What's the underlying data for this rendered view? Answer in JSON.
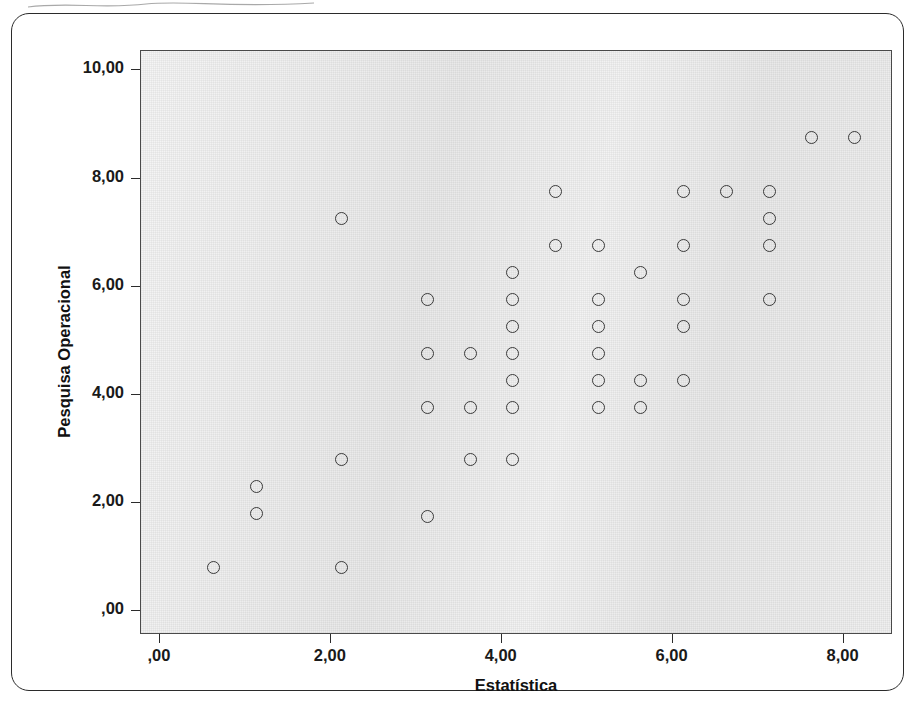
{
  "chart_data": {
    "type": "scatter",
    "title": "",
    "xlabel": "Estatística",
    "ylabel": "Pesquisa Operacional",
    "xlim": [
      -0.35,
      8.45
    ],
    "ylim": [
      -0.2,
      10.6
    ],
    "grid": false,
    "legend": "none",
    "marker": "open-circle",
    "xticks": [
      0,
      2,
      4,
      6,
      8
    ],
    "xticklabels": [
      ",00",
      "2,00",
      "4,00",
      "6,00",
      "8,00"
    ],
    "yticks": [
      0,
      2,
      4,
      6,
      8,
      10
    ],
    "yticklabels": [
      ",00",
      "2,00",
      "4,00",
      "6,00",
      "8,00",
      "10,00"
    ],
    "point_count": 47,
    "points": [
      {
        "x": 0.5,
        "y": 1.05
      },
      {
        "x": 1.0,
        "y": 2.55
      },
      {
        "x": 1.0,
        "y": 2.05
      },
      {
        "x": 2.0,
        "y": 7.5
      },
      {
        "x": 2.0,
        "y": 3.05
      },
      {
        "x": 2.0,
        "y": 1.05
      },
      {
        "x": 3.0,
        "y": 6.0
      },
      {
        "x": 3.0,
        "y": 5.0
      },
      {
        "x": 3.0,
        "y": 4.0
      },
      {
        "x": 3.0,
        "y": 2.0
      },
      {
        "x": 3.5,
        "y": 5.0
      },
      {
        "x": 3.5,
        "y": 4.0
      },
      {
        "x": 3.5,
        "y": 3.05
      },
      {
        "x": 4.0,
        "y": 6.5
      },
      {
        "x": 4.0,
        "y": 6.0
      },
      {
        "x": 4.0,
        "y": 5.5
      },
      {
        "x": 4.0,
        "y": 5.0
      },
      {
        "x": 4.0,
        "y": 4.5
      },
      {
        "x": 4.0,
        "y": 4.0
      },
      {
        "x": 4.0,
        "y": 3.05
      },
      {
        "x": 4.5,
        "y": 8.0
      },
      {
        "x": 4.5,
        "y": 7.0
      },
      {
        "x": 5.0,
        "y": 7.0
      },
      {
        "x": 5.0,
        "y": 6.0
      },
      {
        "x": 5.0,
        "y": 5.5
      },
      {
        "x": 5.0,
        "y": 5.0
      },
      {
        "x": 5.0,
        "y": 4.5
      },
      {
        "x": 5.0,
        "y": 4.0
      },
      {
        "x": 5.5,
        "y": 6.5
      },
      {
        "x": 5.5,
        "y": 4.5
      },
      {
        "x": 5.5,
        "y": 4.0
      },
      {
        "x": 6.0,
        "y": 8.0
      },
      {
        "x": 6.0,
        "y": 7.0
      },
      {
        "x": 6.0,
        "y": 6.0
      },
      {
        "x": 6.0,
        "y": 5.5
      },
      {
        "x": 6.0,
        "y": 4.5
      },
      {
        "x": 6.5,
        "y": 8.0
      },
      {
        "x": 7.0,
        "y": 8.0
      },
      {
        "x": 7.0,
        "y": 7.5
      },
      {
        "x": 7.0,
        "y": 7.0
      },
      {
        "x": 7.0,
        "y": 6.0
      },
      {
        "x": 7.5,
        "y": 9.0
      },
      {
        "x": 8.0,
        "y": 9.0
      }
    ],
    "colors": {
      "plot_background": "#e9e9e9",
      "marker_stroke": "#3a3a3a",
      "axis": "#2b2b2b",
      "text": "#111111",
      "page_background": "#ffffff"
    }
  }
}
